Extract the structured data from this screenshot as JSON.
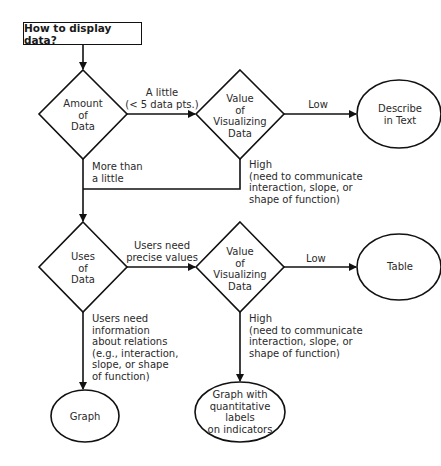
{
  "title": "How to display data?",
  "nodes": {
    "amount": [
      "Amount",
      "of",
      "Data"
    ],
    "value1": [
      "Value",
      "of",
      "Visualizing",
      "Data"
    ],
    "describe": [
      "Describe",
      "in Text"
    ],
    "uses": [
      "Uses",
      "of",
      "Data"
    ],
    "value2": [
      "Value",
      "of",
      "Visualizing",
      "Data"
    ],
    "table": [
      "Table"
    ],
    "graph": [
      "Graph"
    ],
    "graph_labels": [
      "Graph with",
      "quantitative",
      "labels",
      "on indicators"
    ]
  },
  "edges": {
    "a_little": [
      "A little",
      "(< 5 data pts.)"
    ],
    "low1": "Low",
    "high1": [
      "High",
      "(need to communicate",
      "interaction, slope, or",
      "shape of function)"
    ],
    "more_than": [
      "More than",
      "a little"
    ],
    "precise": [
      "Users need",
      "precise values"
    ],
    "low2": "Low",
    "high2": [
      "High",
      "(need to communicate",
      "interaction, slope, or",
      "shape of function)"
    ],
    "relations": [
      "Users need",
      "information",
      "about relations",
      "(e.g., interaction,",
      "slope, or shape",
      "of function)"
    ]
  }
}
